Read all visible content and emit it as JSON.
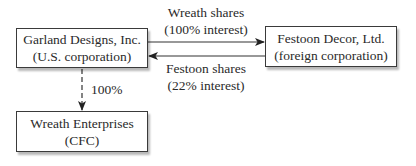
{
  "nodes": {
    "garland": {
      "line1": "Garland Designs, Inc.",
      "line2": "(U.S. corporation)"
    },
    "festoon": {
      "line1": "Festoon Decor, Ltd.",
      "line2": "(foreign corporation)"
    },
    "wreath": {
      "line1": "Wreath Enterprises",
      "line2": "(CFC)"
    }
  },
  "edges": {
    "wreath_shares": {
      "line1": "Wreath shares",
      "line2": "(100% interest)",
      "from": "garland",
      "to": "festoon"
    },
    "festoon_shares": {
      "line1": "Festoon shares",
      "line2": "(22% interest)",
      "from": "festoon",
      "to": "garland"
    },
    "ownership": {
      "label": "100%",
      "from": "garland",
      "to": "wreath",
      "style": "dashed"
    }
  }
}
